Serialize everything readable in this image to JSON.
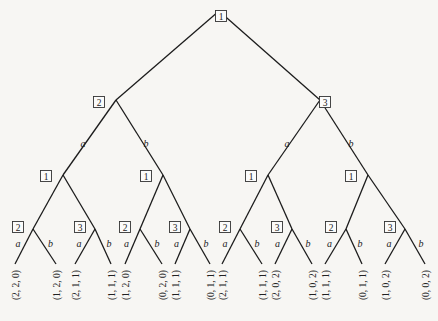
{
  "diagram": {
    "type": "extensive-form game tree",
    "players": [
      "1",
      "2",
      "3"
    ],
    "actions": [
      "a",
      "b"
    ],
    "colors": {
      "line": "#1c1c1c",
      "background": "#f7f6f3"
    },
    "nodes": [
      {
        "id": "root",
        "player": "1",
        "x": 219,
        "y": 11,
        "lx": 221,
        "ly": 16
      },
      {
        "id": "n2",
        "player": "2",
        "x": 116,
        "y": 100,
        "lx": 99,
        "ly": 102
      },
      {
        "id": "n3",
        "player": "3",
        "x": 320,
        "y": 100,
        "lx": 325,
        "ly": 102
      },
      {
        "id": "n11",
        "player": "1",
        "x": 63,
        "y": 175,
        "lx": 46,
        "ly": 176
      },
      {
        "id": "n12",
        "player": "1",
        "x": 163,
        "y": 175,
        "lx": 146,
        "ly": 176
      },
      {
        "id": "n13",
        "player": "1",
        "x": 268,
        "y": 175,
        "lx": 251,
        "ly": 176
      },
      {
        "id": "n14",
        "player": "1",
        "x": 368,
        "y": 175,
        "lx": 351,
        "ly": 176
      },
      {
        "id": "n21",
        "player": "2",
        "x": 33,
        "y": 229,
        "lx": 18,
        "ly": 227
      },
      {
        "id": "n22",
        "player": "3",
        "x": 95,
        "y": 229,
        "lx": 80,
        "ly": 227
      },
      {
        "id": "n23",
        "player": "2",
        "x": 140,
        "y": 229,
        "lx": 125,
        "ly": 227
      },
      {
        "id": "n24",
        "player": "3",
        "x": 190,
        "y": 229,
        "lx": 175,
        "ly": 227
      },
      {
        "id": "n25",
        "player": "2",
        "x": 240,
        "y": 229,
        "lx": 225,
        "ly": 227
      },
      {
        "id": "n26",
        "player": "3",
        "x": 292,
        "y": 229,
        "lx": 277,
        "ly": 227
      },
      {
        "id": "n27",
        "player": "2",
        "x": 346,
        "y": 229,
        "lx": 331,
        "ly": 227
      },
      {
        "id": "n28",
        "player": "3",
        "x": 405,
        "y": 229,
        "lx": 390,
        "ly": 227
      }
    ],
    "edges": [
      {
        "from": [
          219,
          11
        ],
        "to": [
          116,
          100
        ],
        "action": ""
      },
      {
        "from": [
          219,
          11
        ],
        "to": [
          320,
          100
        ],
        "action": ""
      },
      {
        "from": [
          116,
          100
        ],
        "to": [
          63,
          175
        ],
        "action": "a",
        "tx": 83,
        "ty": 143
      },
      {
        "from": [
          116,
          100
        ],
        "to": [
          163,
          175
        ],
        "action": "b",
        "tx": 146,
        "ty": 143
      },
      {
        "from": [
          320,
          100
        ],
        "to": [
          268,
          175
        ],
        "action": "a",
        "tx": 287,
        "ty": 143
      },
      {
        "from": [
          320,
          100
        ],
        "to": [
          368,
          175
        ],
        "action": "b",
        "tx": 351,
        "ty": 143
      },
      {
        "from": [
          63,
          175
        ],
        "to": [
          33,
          229
        ],
        "action": ""
      },
      {
        "from": [
          63,
          175
        ],
        "to": [
          95,
          229
        ],
        "action": ""
      },
      {
        "from": [
          163,
          175
        ],
        "to": [
          140,
          229
        ],
        "action": ""
      },
      {
        "from": [
          163,
          175
        ],
        "to": [
          190,
          229
        ],
        "action": ""
      },
      {
        "from": [
          268,
          175
        ],
        "to": [
          240,
          229
        ],
        "action": ""
      },
      {
        "from": [
          268,
          175
        ],
        "to": [
          292,
          229
        ],
        "action": ""
      },
      {
        "from": [
          368,
          175
        ],
        "to": [
          346,
          229
        ],
        "action": ""
      },
      {
        "from": [
          368,
          175
        ],
        "to": [
          405,
          229
        ],
        "action": ""
      }
    ],
    "leaves": [
      {
        "parent": "n21",
        "action": "a",
        "x": 15,
        "payoff": "(2, 2, 0)"
      },
      {
        "parent": "n21",
        "action": "b",
        "x": 56,
        "payoff": "(1, 2, 0)"
      },
      {
        "parent": "n22",
        "action": "a",
        "x": 75,
        "payoff": "(2, 1, 1)"
      },
      {
        "parent": "n22",
        "action": "b",
        "x": 111,
        "payoff": "(1, 1, 1)"
      },
      {
        "parent": "n23",
        "action": "a",
        "x": 125,
        "payoff": "(1, 2, 0)"
      },
      {
        "parent": "n23",
        "action": "b",
        "x": 162,
        "payoff": "(0, 2, 0)"
      },
      {
        "parent": "n24",
        "action": "a",
        "x": 175,
        "payoff": "(1, 1, 1)"
      },
      {
        "parent": "n24",
        "action": "b",
        "x": 210,
        "payoff": "(0, 1, 1)"
      },
      {
        "parent": "n25",
        "action": "a",
        "x": 222,
        "payoff": "(2, 1, 1)"
      },
      {
        "parent": "n25",
        "action": "b",
        "x": 262,
        "payoff": "(1, 1, 1)"
      },
      {
        "parent": "n26",
        "action": "a",
        "x": 275,
        "payoff": "(2, 0, 2)"
      },
      {
        "parent": "n26",
        "action": "b",
        "x": 312,
        "payoff": "(1, 0, 2)"
      },
      {
        "parent": "n27",
        "action": "a",
        "x": 325,
        "payoff": "(1, 1, 1)"
      },
      {
        "parent": "n27",
        "action": "b",
        "x": 362,
        "payoff": "(0, 1, 1)"
      },
      {
        "parent": "n28",
        "action": "a",
        "x": 385,
        "payoff": "(1, 0, 2)"
      },
      {
        "parent": "n28",
        "action": "b",
        "x": 425,
        "payoff": "(0, 0, 2)"
      }
    ],
    "leaf_y": 264
  }
}
